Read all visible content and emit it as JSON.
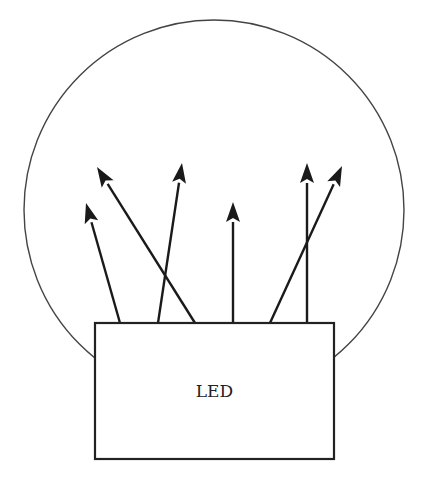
{
  "diagram": {
    "box_label": "LED",
    "colors": {
      "stroke": "#222222",
      "circle": "#444444",
      "background": "#ffffff"
    },
    "circle": {
      "cx": 214,
      "cy": 210,
      "r": 190
    },
    "box": {
      "x": 95,
      "y": 323,
      "width": 239,
      "height": 136
    },
    "rays": [
      {
        "from": [
          120,
          323
        ],
        "to": [
          86,
          203
        ]
      },
      {
        "from": [
          195,
          323
        ],
        "to": [
          97,
          167
        ]
      },
      {
        "from": [
          158,
          323
        ],
        "to": [
          182,
          163
        ]
      },
      {
        "from": [
          233,
          323
        ],
        "to": [
          233,
          202
        ]
      },
      {
        "from": [
          307,
          323
        ],
        "to": [
          307,
          163
        ]
      },
      {
        "from": [
          270,
          323
        ],
        "to": [
          342,
          166
        ]
      }
    ]
  }
}
